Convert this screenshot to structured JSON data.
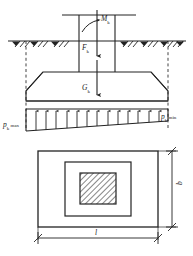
{
  "figure": {
    "type": "engineering-diagram",
    "width": 193,
    "height": 256,
    "stroke_color": "#222222",
    "background_color": "#ffffff"
  },
  "section_view": {
    "name": "elevation-section",
    "ground_line": {
      "label": "ground-surface",
      "y": 41,
      "x_start": 8,
      "x_end": 186
    },
    "loads": [
      {
        "id": "moment",
        "symbol": "M",
        "subscript": "k",
        "kind": "moment",
        "label": "Mk"
      },
      {
        "id": "axial-force",
        "symbol": "F",
        "subscript": "k",
        "kind": "vertical-force",
        "label": "Fk"
      },
      {
        "id": "self-weight",
        "symbol": "G",
        "subscript": "k",
        "kind": "vertical-force",
        "label": "Gk"
      }
    ],
    "pressures": [
      {
        "id": "pressure-max",
        "symbol": "p",
        "subscript": "k",
        "suffix": "max",
        "label": "pk max",
        "side": "left"
      },
      {
        "id": "pressure-min",
        "symbol": "p",
        "subscript": "k",
        "suffix": "min",
        "label": "pk min",
        "side": "right"
      }
    ],
    "pressure_diagram": {
      "type": "trapezoidal",
      "description": "linearly varying soil reaction, maximum at left edge, minimum at right edge",
      "arrow_count": 13,
      "direction": "upward"
    },
    "footing_shape": "trapezoidal-stepped",
    "column": {
      "label": "column",
      "width_px": 34
    }
  },
  "plan_view": {
    "name": "plan-section",
    "rectangles": [
      {
        "id": "footing-outline",
        "label": "footing-base"
      },
      {
        "id": "pedestal-outline",
        "label": "pedestal"
      },
      {
        "id": "column-section",
        "label": "column-hatched",
        "hatched": true
      }
    ],
    "dimensions": [
      {
        "id": "length",
        "label": "l",
        "orientation": "horizontal",
        "position": "bottom"
      },
      {
        "id": "width",
        "label": "b",
        "orientation": "vertical",
        "position": "right"
      }
    ]
  }
}
